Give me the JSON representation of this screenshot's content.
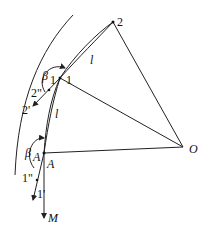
{
  "labels": {
    "p2": "2",
    "p1": "1",
    "l_top": "l",
    "l_mid": "l",
    "beta1_main": "β",
    "beta1_sub": "1",
    "betaA_main": "β",
    "betaA_sub": "A",
    "p2dd": "2\"",
    "p2d": "2'",
    "pA": "A",
    "p1dd": "1\"",
    "p1d": "1'",
    "pM": "M",
    "pO": "O"
  }
}
